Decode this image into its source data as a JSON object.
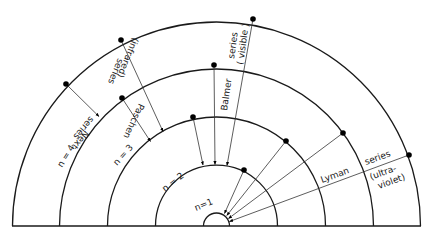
{
  "diagram": {
    "nucleus": {
      "cx": 216.5,
      "cy": 226
    },
    "orbits": [
      {
        "label": "n=1",
        "r": 13
      },
      {
        "label": "n = 2",
        "r": 61
      },
      {
        "label": "n = 3",
        "r": 109
      },
      {
        "label": "n = 4",
        "r": 157
      },
      {
        "label": "",
        "r": 204
      }
    ],
    "series": [
      {
        "name": "Lyman",
        "line1": "Lyman",
        "line2": "series",
        "line3": "(ultra-",
        "line4": "violet)"
      },
      {
        "name": "Balmer",
        "line1": "Balmer",
        "line2": "series",
        "line3": "( visible )"
      },
      {
        "name": "Paschen",
        "line1": "Paschen",
        "line2": "series",
        "line3": "(infrared)"
      },
      {
        "name": "Next",
        "line1": "Next",
        "line2": "series"
      }
    ],
    "colors": {
      "stroke": "#1a1a1a",
      "background": "#ffffff"
    }
  }
}
